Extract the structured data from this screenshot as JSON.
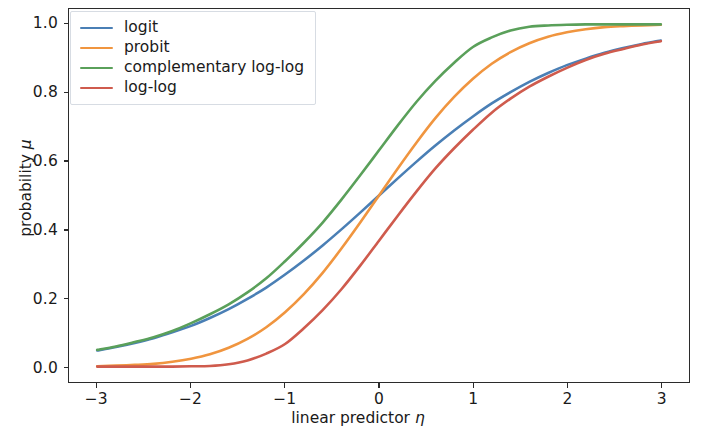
{
  "chart_data": {
    "type": "line",
    "title": "",
    "xlabel": "linear predictor η",
    "xlabel_text": "linear predictor ",
    "xlabel_symbol": "η",
    "ylabel": "probability μ",
    "ylabel_text": "probability ",
    "ylabel_symbol": "μ",
    "xlim": [
      -3.3,
      3.3
    ],
    "ylim": [
      -0.045,
      1.045
    ],
    "xticks": [
      -3,
      -2,
      -1,
      0,
      1,
      2,
      3
    ],
    "xticklabels": [
      "−3",
      "−2",
      "−1",
      "0",
      "1",
      "2",
      "3"
    ],
    "yticks": [
      0.0,
      0.2,
      0.4,
      0.6,
      0.8,
      1.0
    ],
    "yticklabels": [
      "0.0",
      "0.2",
      "0.4",
      "0.6",
      "0.8",
      "1.0"
    ],
    "grid": false,
    "legend_position": "upper left",
    "x": [
      -3.0,
      -2.8,
      -2.6,
      -2.4,
      -2.2,
      -2.0,
      -1.8,
      -1.6,
      -1.4,
      -1.2,
      -1.0,
      -0.8,
      -0.6,
      -0.4,
      -0.2,
      0.0,
      0.2,
      0.4,
      0.6,
      0.8,
      1.0,
      1.2,
      1.4,
      1.6,
      1.8,
      2.0,
      2.2,
      2.4,
      2.6,
      2.8,
      3.0
    ],
    "series": [
      {
        "name": "logit",
        "color": "#4a7fb5",
        "values": [
          0.047,
          0.057,
          0.069,
          0.083,
          0.1,
          0.119,
          0.142,
          0.168,
          0.198,
          0.231,
          0.269,
          0.31,
          0.354,
          0.401,
          0.45,
          0.5,
          0.55,
          0.599,
          0.646,
          0.69,
          0.731,
          0.769,
          0.802,
          0.832,
          0.858,
          0.881,
          0.9,
          0.917,
          0.931,
          0.943,
          0.953
        ]
      },
      {
        "name": "probit",
        "color": "#f0953f",
        "values": [
          0.001,
          0.003,
          0.005,
          0.008,
          0.014,
          0.023,
          0.036,
          0.055,
          0.081,
          0.115,
          0.159,
          0.212,
          0.274,
          0.345,
          0.421,
          0.5,
          0.579,
          0.655,
          0.726,
          0.788,
          0.841,
          0.885,
          0.919,
          0.945,
          0.964,
          0.977,
          0.986,
          0.992,
          0.995,
          0.997,
          0.999
        ]
      },
      {
        "name": "complementary log-log",
        "color": "#5aa05a",
        "values": [
          0.049,
          0.059,
          0.072,
          0.086,
          0.104,
          0.127,
          0.153,
          0.182,
          0.217,
          0.258,
          0.308,
          0.362,
          0.421,
          0.488,
          0.559,
          0.632,
          0.705,
          0.774,
          0.835,
          0.888,
          0.934,
          0.962,
          0.982,
          0.993,
          0.997,
          0.999,
          1.0,
          1.0,
          1.0,
          1.0,
          1.0
        ]
      },
      {
        "name": "log-log",
        "color": "#cf5b4d",
        "values": [
          0.0,
          0.0,
          0.0,
          0.0,
          0.0,
          0.001,
          0.002,
          0.007,
          0.018,
          0.038,
          0.066,
          0.112,
          0.165,
          0.226,
          0.295,
          0.368,
          0.441,
          0.512,
          0.579,
          0.638,
          0.692,
          0.742,
          0.783,
          0.818,
          0.847,
          0.873,
          0.896,
          0.914,
          0.928,
          0.941,
          0.951
        ]
      }
    ]
  },
  "legend": {
    "items": [
      {
        "label": "logit",
        "color": "#4a7fb5"
      },
      {
        "label": "probit",
        "color": "#f0953f"
      },
      {
        "label": "complementary log-log",
        "color": "#5aa05a"
      },
      {
        "label": "log-log",
        "color": "#cf5b4d"
      }
    ]
  }
}
